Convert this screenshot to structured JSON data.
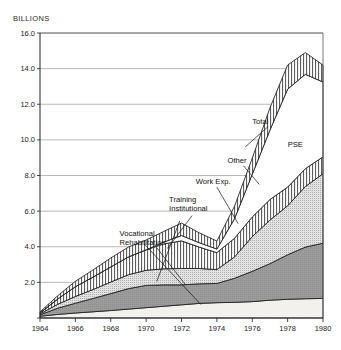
{
  "axis_unit_label": "BILLIONS",
  "chart_data": {
    "type": "area",
    "title": "",
    "subtitle": "",
    "xlabel": "",
    "ylabel": "BILLIONS",
    "stacked": true,
    "grid": true,
    "legend_position": "inline-annotations",
    "xlim": [
      1964,
      1980
    ],
    "ylim": [
      0,
      16.0
    ],
    "x": [
      1964,
      1965,
      1966,
      1967,
      1968,
      1969,
      1970,
      1971,
      1972,
      1973,
      1974,
      1975,
      1976,
      1977,
      1978,
      1979,
      1980
    ],
    "xticks": [
      1964,
      1966,
      1968,
      1970,
      1972,
      1974,
      1976,
      1978,
      1980
    ],
    "xtick_labels": [
      "1964",
      "1966",
      "1968",
      "1970",
      "1972",
      "1974",
      "1976",
      "1978",
      "1980"
    ],
    "yticks": [
      0,
      2.0,
      4.0,
      6.0,
      8.0,
      10.0,
      12.0,
      14.0,
      16.0
    ],
    "ytick_labels": [
      "",
      "2.0",
      "4.0",
      "6.0",
      "8.0",
      "10.0",
      "12.0",
      "14.0",
      "16.0"
    ],
    "series": [
      {
        "name": "Vocational Rehabilitation",
        "fill": "#f0efec",
        "pattern": "light-solid",
        "values": [
          0.1,
          0.2,
          0.28,
          0.35,
          0.42,
          0.5,
          0.58,
          0.66,
          0.74,
          0.82,
          0.86,
          0.88,
          0.92,
          1.0,
          1.05,
          1.08,
          1.1
        ]
      },
      {
        "name": "Other",
        "fill": "#9c9c9c",
        "pattern": "mid-solid",
        "values": [
          0.08,
          0.35,
          0.55,
          0.75,
          0.95,
          1.15,
          1.25,
          1.2,
          1.12,
          1.1,
          1.08,
          1.35,
          1.7,
          2.05,
          2.5,
          2.9,
          3.1
        ]
      },
      {
        "name": "Work Exp.",
        "fill": "#cfcfcf",
        "pattern": "fine-dot",
        "values": [
          0.05,
          0.22,
          0.38,
          0.5,
          0.65,
          0.78,
          0.85,
          0.9,
          0.92,
          0.86,
          0.78,
          1.2,
          1.95,
          2.45,
          2.75,
          3.4,
          3.9
        ]
      },
      {
        "name": "Training Institutional",
        "fill": "#ffffff",
        "pattern": "vertical-hatch",
        "values": [
          0.06,
          0.3,
          0.55,
          0.7,
          0.85,
          1.0,
          1.15,
          1.4,
          1.55,
          1.2,
          0.95,
          1.05,
          1.1,
          1.15,
          1.05,
          1.0,
          0.95
        ]
      },
      {
        "name": "PSE",
        "fill": "#ffffff",
        "pattern": "plain-white",
        "values": [
          0.0,
          0.0,
          0.0,
          0.0,
          0.0,
          0.0,
          0.0,
          0.1,
          0.3,
          0.25,
          0.2,
          1.1,
          2.4,
          3.9,
          5.5,
          5.3,
          4.2
        ]
      },
      {
        "name": "Total",
        "fill": "#ffffff",
        "pattern": "vertical-hatch-cap",
        "values": [
          0.05,
          0.18,
          0.3,
          0.4,
          0.5,
          0.55,
          0.55,
          0.6,
          0.7,
          0.55,
          0.45,
          0.7,
          0.9,
          1.25,
          1.35,
          1.22,
          0.95
        ]
      }
    ],
    "totals": [
      0.34,
      1.25,
      2.06,
      2.7,
      3.37,
      3.98,
      4.38,
      4.86,
      5.33,
      4.78,
      4.32,
      6.28,
      8.97,
      11.8,
      14.2,
      13.9,
      14.2
    ],
    "annotations": [
      {
        "text": "Total",
        "x": 1976.0,
        "y": 10.9
      },
      {
        "text": "Other",
        "x": 1974.6,
        "y": 8.7
      },
      {
        "text": "PSE",
        "x": 1978.0,
        "y": 9.6
      },
      {
        "text": "Work Exp.",
        "x": 1972.8,
        "y": 7.5
      },
      {
        "text": "Training",
        "x": 1971.3,
        "y": 6.5
      },
      {
        "text": "Institutional",
        "x": 1971.3,
        "y": 6.0
      },
      {
        "text": "Vocational",
        "x": 1968.5,
        "y": 4.6
      },
      {
        "text": "Rehabilitation",
        "x": 1968.5,
        "y": 4.1
      }
    ]
  }
}
